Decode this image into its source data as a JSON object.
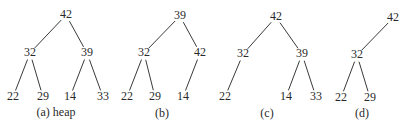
{
  "figure": {
    "trees": [
      {
        "id": "a",
        "caption": "(a) heap",
        "caption_pos": [
          56,
          113
        ],
        "nodes": [
          {
            "label": "42",
            "x": 66,
            "y": 15
          },
          {
            "label": "32",
            "x": 30,
            "y": 53
          },
          {
            "label": "39",
            "x": 87,
            "y": 53
          },
          {
            "label": "22",
            "x": 13,
            "y": 97
          },
          {
            "label": "29",
            "x": 43,
            "y": 97
          },
          {
            "label": "14",
            "x": 70,
            "y": 97
          },
          {
            "label": "33",
            "x": 103,
            "y": 97
          }
        ],
        "edges": [
          [
            0,
            1
          ],
          [
            0,
            2
          ],
          [
            1,
            3
          ],
          [
            1,
            4
          ],
          [
            2,
            5
          ],
          [
            2,
            6
          ]
        ]
      },
      {
        "id": "b",
        "caption": "(b)",
        "caption_pos": [
          162,
          114
        ],
        "nodes": [
          {
            "label": "39",
            "x": 180,
            "y": 16
          },
          {
            "label": "32",
            "x": 144,
            "y": 53
          },
          {
            "label": "42",
            "x": 200,
            "y": 53
          },
          {
            "label": "22",
            "x": 127,
            "y": 97
          },
          {
            "label": "29",
            "x": 155,
            "y": 97
          },
          {
            "label": "14",
            "x": 183,
            "y": 97
          }
        ],
        "edges": [
          [
            0,
            1
          ],
          [
            0,
            2
          ],
          [
            1,
            3
          ],
          [
            1,
            4
          ],
          [
            2,
            5
          ]
        ]
      },
      {
        "id": "c",
        "caption": "(c)",
        "caption_pos": [
          267,
          114
        ],
        "nodes": [
          {
            "label": "42",
            "x": 276,
            "y": 17
          },
          {
            "label": "32",
            "x": 243,
            "y": 54
          },
          {
            "label": "39",
            "x": 302,
            "y": 54
          },
          {
            "label": "22",
            "x": 225,
            "y": 97
          },
          {
            "label": "14",
            "x": 286,
            "y": 97
          },
          {
            "label": "33",
            "x": 316,
            "y": 97
          }
        ],
        "edges": [
          [
            0,
            1
          ],
          [
            0,
            2
          ],
          [
            1,
            3
          ],
          [
            2,
            4
          ],
          [
            2,
            5
          ]
        ]
      },
      {
        "id": "d",
        "caption": "(d)",
        "caption_pos": [
          362,
          114
        ],
        "nodes": [
          {
            "label": "42",
            "x": 393,
            "y": 18
          },
          {
            "label": "32",
            "x": 357,
            "y": 55
          },
          {
            "label": "22",
            "x": 341,
            "y": 98
          },
          {
            "label": "29",
            "x": 370,
            "y": 98
          }
        ],
        "edges": [
          [
            0,
            1
          ],
          [
            1,
            2
          ],
          [
            1,
            3
          ]
        ]
      }
    ],
    "colors": {
      "edge": "#3a3a3a",
      "text": "#2a2a2a",
      "background": "#ffffff"
    }
  }
}
